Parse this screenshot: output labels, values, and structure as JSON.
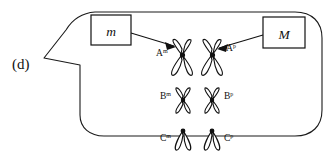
{
  "figure": {
    "panel_label": "(d)",
    "type": "diagram"
  },
  "allele_boxes": [
    {
      "id": "maternal-allele-box",
      "label": "m",
      "style": "italic lowercase"
    },
    {
      "id": "paternal-allele-box",
      "label": "M",
      "style": "italic uppercase"
    }
  ],
  "chromosome_pairs": [
    {
      "pair_id": "A",
      "shape": "metacentric",
      "left": {
        "locus": "A",
        "superscript": "m",
        "full": "Am",
        "label_side": "left"
      },
      "right": {
        "locus": "A",
        "superscript": "p",
        "full": "Ap",
        "label_side": "right"
      }
    },
    {
      "pair_id": "B",
      "shape": "metacentric",
      "left": {
        "locus": "B",
        "superscript": "m",
        "full": "Bm",
        "label_side": "left"
      },
      "right": {
        "locus": "B",
        "superscript": "p",
        "full": "Bp",
        "label_side": "right"
      }
    },
    {
      "pair_id": "C",
      "shape": "acrocentric",
      "left": {
        "locus": "C",
        "superscript": "m",
        "full": "Cm",
        "label_side": "left"
      },
      "right": {
        "locus": "C",
        "superscript": "p",
        "full": "Cp",
        "label_side": "right"
      }
    }
  ],
  "connectors": [
    {
      "id": "m-to-A-maternal",
      "from": "maternal-allele-box",
      "to": "A-maternal-chromosome",
      "arrow": true
    },
    {
      "id": "M-to-A-paternal",
      "from": "paternal-allele-box",
      "to": "A-paternal-chromosome",
      "arrow": true
    }
  ],
  "colors": {
    "background": "#ffffff",
    "stroke": "#111111",
    "callout_stroke": "#1a1a1a",
    "centromere": "#111111"
  }
}
